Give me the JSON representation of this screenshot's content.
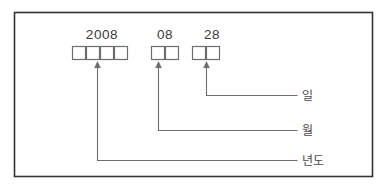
{
  "figure": {
    "border_color": "#333333",
    "line_color": "#6e6e6e",
    "text_color": "#3a3a3a"
  },
  "groups": [
    {
      "id": "year",
      "number": "2008",
      "box_count": 4,
      "label": "년도"
    },
    {
      "id": "month",
      "number": "08",
      "box_count": 2,
      "label": "월"
    },
    {
      "id": "day",
      "number": "28",
      "box_count": 2,
      "label": "일"
    }
  ],
  "numbers": {
    "year": "2008",
    "month": "08",
    "day": "28"
  },
  "labels": {
    "year": "년도",
    "month": "월",
    "day": "일"
  }
}
